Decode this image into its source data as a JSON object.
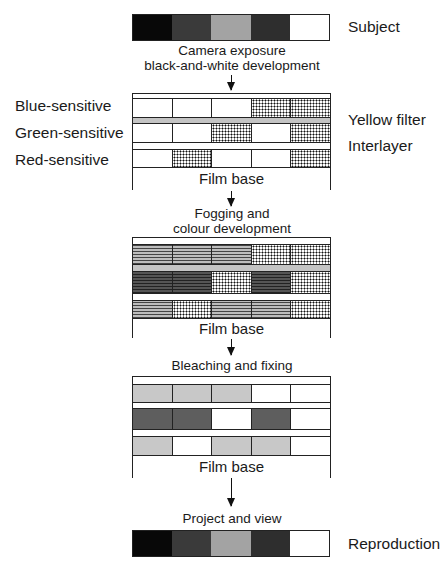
{
  "subject": {
    "label": "Subject",
    "patches": [
      "#080808",
      "#3a3a3a",
      "#a3a3a3",
      "#2e2e2e",
      "#ffffff"
    ]
  },
  "step1": {
    "line1": "Camera exposure",
    "line2": "black-and-white development"
  },
  "layer_labels": {
    "blue": "Blue-sensitive",
    "green": "Green-sensitive",
    "red": "Red-sensitive",
    "yellow_filter": "Yellow filter",
    "interlayer": "Interlayer"
  },
  "stage1": {
    "base_label": "Film base",
    "rows": {
      "blue": [
        "white",
        "white",
        "white",
        "dot",
        "dot"
      ],
      "green": [
        "white",
        "white",
        "dot",
        "white",
        "dot"
      ],
      "red": [
        "white",
        "dot",
        "white",
        "white",
        "dot"
      ]
    }
  },
  "step2": {
    "line1": "Fogging and",
    "line2": "colour development"
  },
  "stage2": {
    "base_label": "Film base",
    "rows": {
      "blue": [
        "dash",
        "dash",
        "dash",
        "dot",
        "dot"
      ],
      "green": [
        "darkdash",
        "darkdash",
        "dot",
        "darkdash",
        "dot"
      ],
      "red": [
        "dash",
        "dot",
        "dash",
        "dash",
        "dot"
      ]
    }
  },
  "step3": {
    "line1": "Bleaching and fixing"
  },
  "stage3": {
    "base_label": "Film base",
    "rows": {
      "blue": [
        "light",
        "light",
        "light",
        "white",
        "white"
      ],
      "green": [
        "dark",
        "dark",
        "white",
        "dark",
        "white"
      ],
      "red": [
        "light",
        "white",
        "light",
        "light",
        "white"
      ]
    }
  },
  "step4": {
    "line1": "Project and view"
  },
  "reproduction": {
    "label": "Reproduction",
    "patches": [
      "#080808",
      "#3a3a3a",
      "#a3a3a3",
      "#2e2e2e",
      "#ffffff"
    ]
  }
}
